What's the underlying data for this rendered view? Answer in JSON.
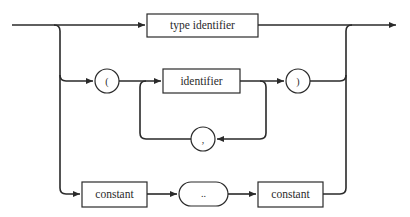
{
  "diagram": {
    "type": "syntax-diagram",
    "nodes": {
      "type_identifier": "type identifier",
      "open_paren": "(",
      "identifier": "identifier",
      "close_paren": ")",
      "comma": ",",
      "constant_lower": "constant",
      "range": "..",
      "constant_upper": "constant"
    },
    "paths": [
      [
        "type identifier"
      ],
      [
        "(",
        "identifier",
        "{ , identifier }",
        ")"
      ],
      [
        "constant",
        "..",
        "constant"
      ]
    ],
    "colors": {
      "stroke": "#2a2a2a",
      "background": "#ffffff"
    }
  }
}
